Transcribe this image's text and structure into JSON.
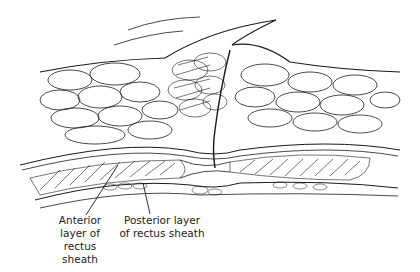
{
  "figure": {
    "type": "anatomical-illustration",
    "colors": {
      "ink": "#1a1a1a",
      "background": "#ffffff"
    },
    "labels": [
      {
        "id": "anterior",
        "lines": [
          "Anterior",
          "layer of",
          "rectus",
          "sheath"
        ],
        "pointer_to": [
          130,
          188
        ]
      },
      {
        "id": "posterior",
        "lines": [
          "Posterior layer",
          "of rectus sheath"
        ],
        "pointer_to": [
          143,
          168
        ]
      }
    ]
  }
}
